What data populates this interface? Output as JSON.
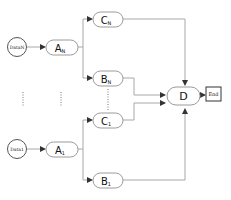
{
  "diagram": {
    "top_group": {
      "data": {
        "label": "DataN"
      },
      "a": {
        "label": "A",
        "sub": "N"
      },
      "c": {
        "label": "C",
        "sub": "N"
      },
      "b": {
        "label": "B",
        "sub": "N"
      }
    },
    "bottom_group": {
      "data": {
        "label": "Data1"
      },
      "a": {
        "label": "A",
        "sub": "1"
      },
      "c": {
        "label": "C",
        "sub": "1"
      },
      "b": {
        "label": "B",
        "sub": "1"
      }
    },
    "merge": {
      "label": "D"
    },
    "end": {
      "label": "End"
    },
    "colors": {
      "stroke": "#9a9a9a",
      "node_fill": "#ffffff",
      "text": "#111111",
      "arrow": "#333333",
      "end_border": "#333333"
    }
  }
}
